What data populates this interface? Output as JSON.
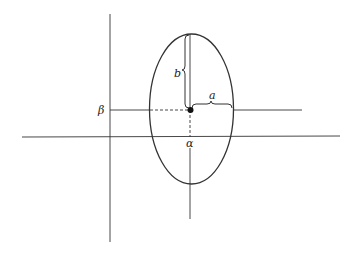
{
  "diagram": {
    "labels": {
      "alpha": "α",
      "beta": "β",
      "a": "a",
      "b": "b"
    },
    "colors": {
      "stroke": "#333333",
      "background": "#ffffff"
    }
  }
}
